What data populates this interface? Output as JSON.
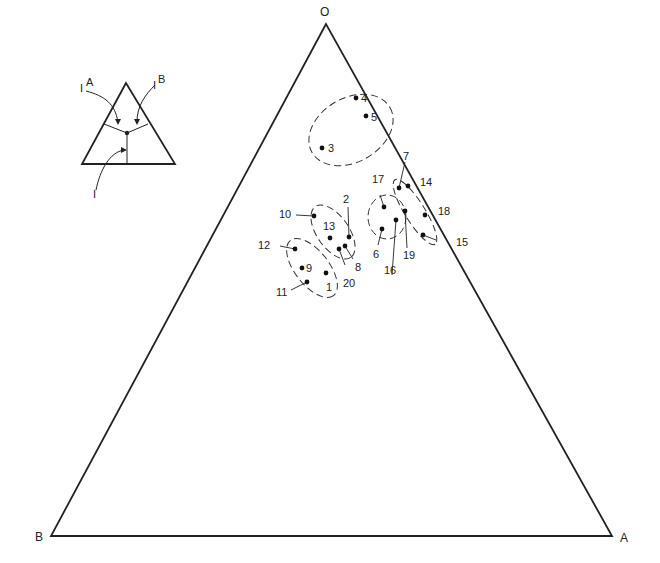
{
  "diagram": {
    "type": "ternary",
    "vertices": {
      "top": {
        "label": "O",
        "x": 326,
        "y": 24
      },
      "left": {
        "label": "B",
        "x": 51,
        "y": 536
      },
      "right": {
        "label": "A",
        "x": 612,
        "y": 536
      }
    },
    "inset": {
      "labels": {
        "ia": "I",
        "ia_sup": "A",
        "ib": "I",
        "ib_sup": "B",
        "i": "I"
      }
    },
    "points": [
      {
        "id": "1",
        "x": 326,
        "y": 273
      },
      {
        "id": "2",
        "x": 349,
        "y": 237
      },
      {
        "id": "3",
        "x": 322,
        "y": 148
      },
      {
        "id": "4",
        "x": 356,
        "y": 98
      },
      {
        "id": "5",
        "x": 366,
        "y": 116
      },
      {
        "id": "6",
        "x": 382,
        "y": 229
      },
      {
        "id": "7",
        "x": 399,
        "y": 188
      },
      {
        "id": "8",
        "x": 345,
        "y": 246
      },
      {
        "id": "9",
        "x": 302,
        "y": 268
      },
      {
        "id": "10",
        "x": 314,
        "y": 216
      },
      {
        "id": "11",
        "x": 307,
        "y": 282
      },
      {
        "id": "12",
        "x": 295,
        "y": 249
      },
      {
        "id": "13",
        "x": 330,
        "y": 238
      },
      {
        "id": "14",
        "x": 408,
        "y": 186
      },
      {
        "id": "15",
        "x": 423,
        "y": 235
      },
      {
        "id": "16",
        "x": 396,
        "y": 220
      },
      {
        "id": "17",
        "x": 384,
        "y": 207
      },
      {
        "id": "18",
        "x": 425,
        "y": 215
      },
      {
        "id": "19",
        "x": 405,
        "y": 211
      },
      {
        "id": "20",
        "x": 339,
        "y": 249
      }
    ]
  }
}
